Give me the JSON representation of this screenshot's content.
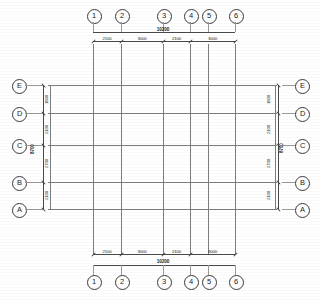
{
  "drawing": {
    "type": "structural-column-grid-plan",
    "overall_width_label": "10200",
    "overall_height_label": "8700"
  },
  "columns": {
    "labels": [
      "1",
      "2",
      "3",
      "4",
      "5",
      "6"
    ],
    "x_positions": [
      93,
      121,
      163,
      190,
      208,
      235
    ],
    "dimensions": [
      {
        "label": "2100",
        "from": "1",
        "to": "2"
      },
      {
        "label": "3000",
        "from": "2",
        "to": "3"
      },
      {
        "label": "2100",
        "from": "3",
        "to": "4"
      },
      {
        "label": "3000",
        "from": "4",
        "to": "6"
      }
    ],
    "total": "10200"
  },
  "rows": {
    "labels": [
      "E",
      "D",
      "C",
      "B",
      "A"
    ],
    "y_positions": [
      85,
      113,
      145,
      182,
      209
    ],
    "dimensions": [
      {
        "label": "1800",
        "from": "E",
        "to": "D"
      },
      {
        "label": "2100",
        "from": "D",
        "to": "C"
      },
      {
        "label": "2700",
        "from": "C",
        "to": "B"
      },
      {
        "label": "2100",
        "from": "B",
        "to": "A"
      }
    ],
    "total": "8700"
  }
}
